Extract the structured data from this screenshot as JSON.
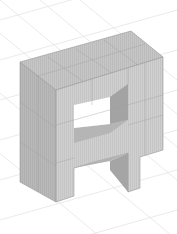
{
  "scene": {
    "subject": "3D voxel block letter A",
    "background": "#ffffff",
    "grid_color": "#e6e6e6",
    "colors": {
      "top_face": "#c9c9c9",
      "front_face": "#cfcfcf",
      "side_face": "#b4b4b4",
      "inner_dark": "#9e9e9e",
      "inner_mid": "#bdbdbd",
      "hole": "#ffffff",
      "edge": "#8a8a8a",
      "cell_line": "#a8a8a8"
    }
  }
}
